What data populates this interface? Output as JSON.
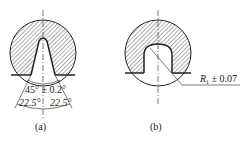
{
  "figures": [
    {
      "id": "a",
      "caption": "(a)",
      "annotations": {
        "included_angle": "45° ± 0.2°",
        "half_angle_left": "22.5°",
        "half_angle_right": "22.5°"
      }
    },
    {
      "id": "b",
      "caption": "(b)",
      "annotations": {
        "radius": "R",
        "radius_subscript": "1",
        "tolerance": " ± 0.07"
      }
    }
  ],
  "colors": {
    "line": "#222222",
    "background": "#ffffff"
  }
}
